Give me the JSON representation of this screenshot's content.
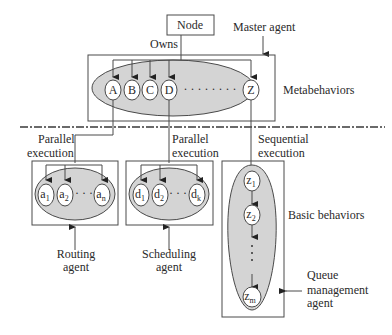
{
  "diagram": {
    "node_label": "Node",
    "owns_label": "Owns",
    "master_agent_label": "Master agent",
    "metabehaviors_label": "Metabehaviors",
    "metabehaviors": [
      "A",
      "B",
      "C",
      "D",
      "Z"
    ],
    "metabehaviors_ellipsis": "· · · · · · · ·",
    "basic_behaviors_label": "Basic behaviors",
    "routing": {
      "exec_line1": "Parallel",
      "exec_line2": "execution",
      "nodes": [
        {
          "base": "a",
          "sub": "1"
        },
        {
          "base": "a",
          "sub": "2"
        },
        {
          "base": "a",
          "sub": "n"
        }
      ],
      "ellipsis": "· · ·",
      "agent_line1": "Routing",
      "agent_line2": "agent"
    },
    "scheduling": {
      "exec_line1": "Parallel",
      "exec_line2": "execution",
      "nodes": [
        {
          "base": "d",
          "sub": "1"
        },
        {
          "base": "d",
          "sub": "2"
        },
        {
          "base": "d",
          "sub": "k"
        }
      ],
      "ellipsis": "· · ·",
      "agent_line1": "Scheduling",
      "agent_line2": "agent"
    },
    "queue": {
      "exec_line1": "Sequential",
      "exec_line2": "execution",
      "nodes": [
        {
          "base": "z",
          "sub": "1"
        },
        {
          "base": "z",
          "sub": "2"
        },
        {
          "base": "z",
          "sub": "m"
        }
      ],
      "agent_line1": "Queue",
      "agent_line2": "management",
      "agent_line3": "agent"
    }
  }
}
